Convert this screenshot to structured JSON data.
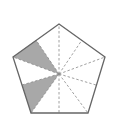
{
  "diagram": {
    "title": "",
    "shape": "regular pentagon divided into 10 triangles from center",
    "colors": {
      "outline": "#666666",
      "dashed": "#888888",
      "shaded": "#a8a8a8",
      "background": "#ffffff"
    },
    "vertices": [
      [
        59,
        24
      ],
      [
        105,
        57
      ],
      [
        88,
        113
      ],
      [
        31,
        113
      ],
      [
        13,
        57
      ]
    ],
    "center": [
      59,
      74
    ],
    "edge_midpoints": [
      [
        82,
        40
      ],
      [
        96,
        85
      ],
      [
        59,
        113
      ],
      [
        22,
        85
      ],
      [
        36,
        40
      ]
    ],
    "shaded_regions": [
      {
        "points": [
          [
            36,
            40
          ],
          [
            13,
            57
          ],
          [
            59,
            74
          ]
        ]
      },
      {
        "points": [
          [
            22,
            85
          ],
          [
            31,
            113
          ],
          [
            59,
            74
          ]
        ]
      }
    ],
    "total_parts": 10,
    "shaded_parts": 2
  }
}
